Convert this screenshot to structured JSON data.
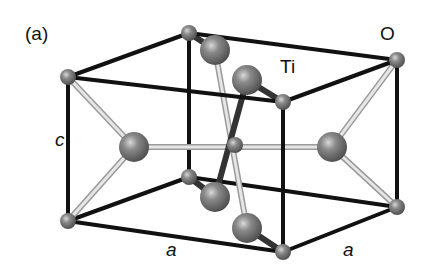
{
  "figure": {
    "panel_label": "(a)",
    "atom_labels": {
      "oxygen": "O",
      "titanium": "Ti"
    },
    "axis_labels": {
      "c": "c",
      "a_front": "a",
      "a_right": "a"
    }
  },
  "colors": {
    "background": "#ffffff",
    "cell_edge": "#111111",
    "bond": "#c8c8c8",
    "atom_fill": "#7a7a7a"
  }
}
